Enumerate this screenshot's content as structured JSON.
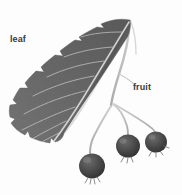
{
  "figure": {
    "medium": "grayscale halftone scan",
    "background_color": "#fdfdfd",
    "width_px": 182,
    "height_px": 195
  },
  "annotations": [
    {
      "id": "leaf",
      "text": "leaf",
      "color": "#3b3b3b",
      "x": 10,
      "y": 35
    },
    {
      "id": "fruit",
      "text": "fruit",
      "color": "#3b3b3b",
      "x": 133,
      "y": 83
    }
  ],
  "elements": {
    "leaf": {
      "name": "leaf",
      "fill_color": "#6b6b6b",
      "edge": "serrated",
      "vein_color": "#d8d8d8",
      "description": "large ovate serrated leaf occupying upper left, midrib running from lower-left tip to upper-right base"
    },
    "stem": {
      "name": "stem",
      "color": "#b9b9b9",
      "description": "pale branching stem descending from leaf base, forking into three fruit stalks"
    },
    "fruits": [
      {
        "name": "fruit-left",
        "cx": 92,
        "cy": 166,
        "r": 13,
        "fill_color": "#4a4a4a"
      },
      {
        "name": "fruit-middle",
        "cx": 128,
        "cy": 146,
        "r": 12,
        "fill_color": "#4a4a4a"
      },
      {
        "name": "fruit-right",
        "cx": 156,
        "cy": 142,
        "r": 11,
        "fill_color": "#4a4a4a"
      }
    ]
  }
}
